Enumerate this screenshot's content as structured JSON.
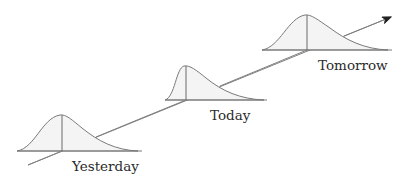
{
  "diagram": {
    "type": "distribution-over-time",
    "labels": {
      "yesterday": "Yesterday",
      "today": "Today",
      "tomorrow": "Tomorrow"
    },
    "distributions": [
      {
        "name": "Yesterday",
        "peak_x": 62,
        "peak_y": 115,
        "baseline_y": 151,
        "x_start": 17,
        "x_end": 142
      },
      {
        "name": "Today",
        "peak_x": 186,
        "peak_y": 66,
        "baseline_y": 100,
        "x_start": 165,
        "x_end": 267
      },
      {
        "name": "Tomorrow",
        "peak_x": 307,
        "peak_y": 15,
        "baseline_y": 50,
        "x_start": 262,
        "x_end": 392
      }
    ],
    "trend_arrow": {
      "direction": "up-right",
      "tip_x": 391,
      "tip_y": 17
    },
    "colors": {
      "stroke": "#7a7a7a",
      "fill": "#f4f4f4",
      "text": "#2a2a2a"
    }
  }
}
